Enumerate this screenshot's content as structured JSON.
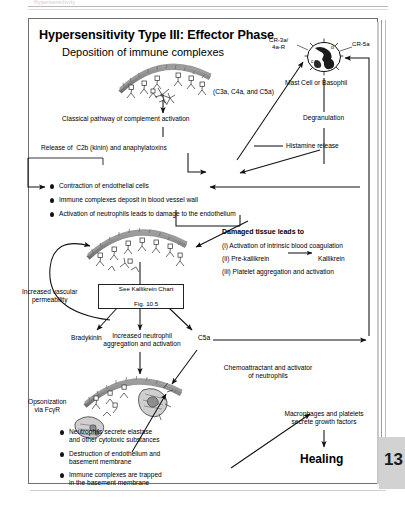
{
  "page": {
    "page_number": "13",
    "header_ghost": "Hypersensitivity"
  },
  "figure": {
    "title": "Hypersensitivity Type III: Effector Phase",
    "subtitle": "Deposition of immune complexes"
  },
  "mast_cell": {
    "receptor_left": "CR-3a/\n4a-R",
    "receptor_right": "CR-5a",
    "caption": "Mast Cell or Basophil",
    "degranulation": "Degranulation",
    "histamine": "Histamine release"
  },
  "pathway": {
    "classical": "Classical pathway of complement activation",
    "anaphylatoxins": "(C3a, C4a, and C5a)",
    "release_c2b": "Release of  C2b (kinin) and anaphylatoxins"
  },
  "effects": {
    "items": [
      "Contraction of endothelial cells",
      "Immune complexes deposit in blood vessel wall",
      "Activation of neutrophils leads to damage to the endothelium"
    ]
  },
  "damaged_tissue": {
    "heading": "Damaged tissue leads to",
    "items": [
      "(i) Activation of intrinsic blood coagulation",
      "(ii) Pre-kallikrein",
      "(iii) Platelet aggregation and activation"
    ],
    "kallikrein_product": "Kallikrein"
  },
  "vascular": {
    "permeability": "Increased vascular\npermeability"
  },
  "kallikrein_box": {
    "line1": "See Kallikrein Chart",
    "line2": "Fig. 10.5"
  },
  "outputs": {
    "bradykinin": "Bradykinin",
    "neutrophil_aggregation": "Increased neutrophil\naggregation and activation",
    "c5a": "C5a",
    "chemoattractant": "Chemoattractant and activator\nof neutrophils"
  },
  "opsonization": {
    "label": "Opsonization\nvia FcγR"
  },
  "damage_list": {
    "items": [
      "Neutrophils secrete elastase\nand other cytotoxic substances",
      "Destruction of endothelium and\nbasement membrane",
      "Immune complexes are trapped\nin the basement membrane"
    ]
  },
  "healing": {
    "growth_factors": "Macrophages and platelets\nsecrete growth factors",
    "label": "Healing"
  },
  "colors": {
    "ink": "#111111",
    "frame": "#707070",
    "page_tab": "#d2d2d2",
    "vessel_wall": "#8a8a8a"
  }
}
